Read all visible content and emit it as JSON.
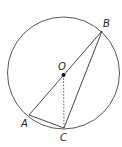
{
  "diagram": {
    "type": "circle-geometry",
    "circle": {
      "cx": 63.5,
      "cy": 73,
      "r": 56,
      "stroke": "#444444"
    },
    "points": {
      "O": {
        "label": "O",
        "x": 63.5,
        "y": 75,
        "label_x": 58,
        "label_y": 70
      },
      "A": {
        "label": "A",
        "x": 29,
        "y": 115,
        "label_x": 21,
        "label_y": 127
      },
      "B": {
        "label": "B",
        "x": 102,
        "y": 31,
        "label_x": 103,
        "label_y": 27
      },
      "C": {
        "label": "C",
        "x": 64,
        "y": 128,
        "label_x": 60,
        "label_y": 141
      }
    },
    "segments": [
      {
        "from": "A",
        "to": "B",
        "style": "solid"
      },
      {
        "from": "B",
        "to": "C",
        "style": "solid"
      },
      {
        "from": "A",
        "to": "C",
        "style": "solid"
      },
      {
        "from": "O",
        "to": "C",
        "style": "dashed"
      }
    ],
    "line_color": "#333333"
  }
}
